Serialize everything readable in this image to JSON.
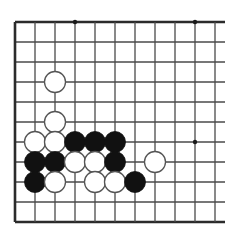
{
  "diagram": {
    "type": "go-board-diagram",
    "board_label": "goban",
    "colors": {
      "background": "#ffffff",
      "grid_line": "#4a4a4a",
      "edge_line": "#2b2b2b",
      "black_stone": "#111111",
      "white_stone_fill": "#ffffff",
      "white_stone_edge": "#555555",
      "star_point": "#1a1a1a"
    },
    "geometry": {
      "origin_x": 15,
      "origin_y": 22,
      "step_x": 20,
      "step_y": 20,
      "cols": 11,
      "rows": 11,
      "stone_radius": 10.5,
      "star_radius": 2.2,
      "edge_width": 2.6,
      "line_width": 1.3,
      "right_overhang": 12
    },
    "edges": {
      "left": true,
      "top": true,
      "bottom": true,
      "right": false
    },
    "star_points": [
      {
        "col": 3,
        "row": 0,
        "name": "star-point-top-left"
      },
      {
        "col": 9,
        "row": 0,
        "name": "star-point-top-right"
      },
      {
        "col": 9,
        "row": 6,
        "name": "star-point-right"
      }
    ],
    "stones": [
      {
        "col": 2,
        "row": 3,
        "color": "white",
        "label": "white-stone-c3-r3"
      },
      {
        "col": 2,
        "row": 5,
        "color": "white",
        "label": "white-stone-c2-r5"
      },
      {
        "col": 1,
        "row": 6,
        "color": "white",
        "label": "white-stone-c1-r6"
      },
      {
        "col": 2,
        "row": 6,
        "color": "white",
        "label": "white-stone-c2-r6"
      },
      {
        "col": 3,
        "row": 6,
        "color": "black",
        "label": "black-stone-c3-r6"
      },
      {
        "col": 4,
        "row": 6,
        "color": "black",
        "label": "black-stone-c4-r6"
      },
      {
        "col": 5,
        "row": 6,
        "color": "black",
        "label": "black-stone-c5-r6"
      },
      {
        "col": 1,
        "row": 7,
        "color": "black",
        "label": "black-stone-c1-r7"
      },
      {
        "col": 2,
        "row": 7,
        "color": "black",
        "label": "black-stone-c2-r7"
      },
      {
        "col": 3,
        "row": 7,
        "color": "white",
        "label": "white-stone-c3-r7"
      },
      {
        "col": 4,
        "row": 7,
        "color": "white",
        "label": "white-stone-c4-r7"
      },
      {
        "col": 5,
        "row": 7,
        "color": "black",
        "label": "black-stone-c5-r7"
      },
      {
        "col": 7,
        "row": 7,
        "color": "white",
        "label": "white-stone-c7-r7"
      },
      {
        "col": 1,
        "row": 8,
        "color": "black",
        "label": "black-stone-c1-r8"
      },
      {
        "col": 2,
        "row": 8,
        "color": "white",
        "label": "white-stone-c2-r8"
      },
      {
        "col": 4,
        "row": 8,
        "color": "white",
        "label": "white-stone-c4-r8"
      },
      {
        "col": 5,
        "row": 8,
        "color": "white",
        "label": "white-stone-c5-r8"
      },
      {
        "col": 6,
        "row": 8,
        "color": "black",
        "label": "black-stone-c6-r8"
      }
    ],
    "counts": {
      "black": 8,
      "white": 10,
      "total": 18
    }
  }
}
